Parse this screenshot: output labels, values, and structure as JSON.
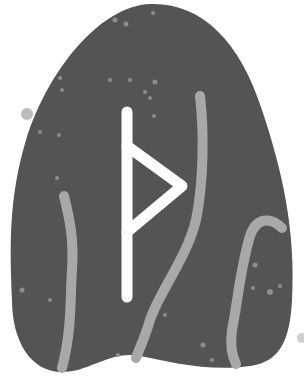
{
  "image": {
    "subject": "rune stone",
    "rune": "thurisaz",
    "rune_glyph": "ᚦ",
    "colors": {
      "background": "#ffffff",
      "stone": "#545454",
      "rune": "#ffffff",
      "veins": "#a8a8a8",
      "specks": "#8e8e8e"
    }
  }
}
